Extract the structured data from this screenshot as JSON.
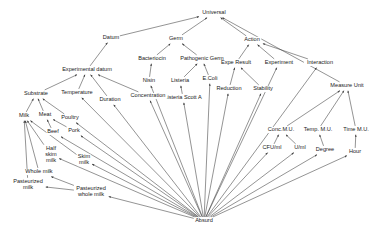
{
  "diagram": {
    "type": "ontology-taxonomy-graph",
    "title": "",
    "edge_style": "arrow",
    "colors": {
      "background": "#ffffff",
      "edge": "#3a3a3a",
      "text": "#1a1a1a"
    },
    "nodes": [
      {
        "id": "universal",
        "label": "Universal",
        "x": 214,
        "y": 13,
        "lines": [
          "Universal"
        ]
      },
      {
        "id": "datum",
        "label": "Datum",
        "x": 111,
        "y": 38,
        "lines": [
          "Datum"
        ]
      },
      {
        "id": "germ",
        "label": "Germ",
        "x": 176,
        "y": 39,
        "lines": [
          "Germ"
        ]
      },
      {
        "id": "action",
        "label": "Action",
        "x": 252,
        "y": 40,
        "lines": [
          "Action"
        ]
      },
      {
        "id": "experimental_datum",
        "label": "Experimental datum",
        "x": 87,
        "y": 70,
        "lines": [
          "Experimental datum"
        ]
      },
      {
        "id": "bacteriocin",
        "label": "Bacteriocin",
        "x": 152,
        "y": 59,
        "lines": [
          "Bacteriocin"
        ]
      },
      {
        "id": "pathogenic_germ",
        "label": "Pathogenic Germ",
        "x": 202,
        "y": 59,
        "lines": [
          "Pathogenic Germ"
        ]
      },
      {
        "id": "expe_result",
        "label": "Expe Result",
        "x": 236,
        "y": 63,
        "lines": [
          "Expe Result"
        ]
      },
      {
        "id": "experiment",
        "label": "Experiment",
        "x": 279,
        "y": 63,
        "lines": [
          "Experiment"
        ]
      },
      {
        "id": "interaction",
        "label": "Interaction",
        "x": 320,
        "y": 63,
        "lines": [
          "Interaction"
        ]
      },
      {
        "id": "nisin",
        "label": "Nisin",
        "x": 149,
        "y": 81,
        "lines": [
          "Nisin"
        ]
      },
      {
        "id": "listeria",
        "label": "Listeria",
        "x": 180,
        "y": 81,
        "lines": [
          "Listeria"
        ]
      },
      {
        "id": "ecoli",
        "label": "E.Coli",
        "x": 210,
        "y": 79,
        "lines": [
          "E.Coli"
        ]
      },
      {
        "id": "listeria_scott_a",
        "label": "Listeria Scott A",
        "x": 183,
        "y": 98,
        "lines": [
          "Listeria Scott A"
        ]
      },
      {
        "id": "reduction",
        "label": "Reduction",
        "x": 229,
        "y": 89,
        "lines": [
          "Reduction"
        ]
      },
      {
        "id": "stability",
        "label": "Stability",
        "x": 263,
        "y": 89,
        "lines": [
          "Stability"
        ]
      },
      {
        "id": "measure_unit",
        "label": "Measure Unit",
        "x": 347,
        "y": 86,
        "lines": [
          "Measure Unit"
        ]
      },
      {
        "id": "substrate",
        "label": "Substrate",
        "x": 36,
        "y": 94,
        "lines": [
          "Substrate"
        ]
      },
      {
        "id": "temperature",
        "label": "Temperature",
        "x": 77,
        "y": 93,
        "lines": [
          "Temperature"
        ]
      },
      {
        "id": "duration",
        "label": "Duration",
        "x": 110,
        "y": 100,
        "lines": [
          "Duration"
        ]
      },
      {
        "id": "concentration",
        "label": "Concentration",
        "x": 148,
        "y": 96,
        "lines": [
          "Concentration"
        ]
      },
      {
        "id": "milk",
        "label": "Milk",
        "x": 24,
        "y": 116,
        "lines": [
          "Milk"
        ]
      },
      {
        "id": "meat",
        "label": "Meat",
        "x": 45,
        "y": 115,
        "lines": [
          "Meat"
        ]
      },
      {
        "id": "poultry",
        "label": "Poultry",
        "x": 70,
        "y": 118,
        "lines": [
          "Poultry"
        ]
      },
      {
        "id": "beef",
        "label": "Beef",
        "x": 53,
        "y": 132,
        "lines": [
          "Beef"
        ]
      },
      {
        "id": "pork",
        "label": "Pork",
        "x": 74,
        "y": 131,
        "lines": [
          "Pork"
        ]
      },
      {
        "id": "half_skim_milk",
        "label": "Half skim milk",
        "x": 51,
        "y": 155,
        "lines": [
          "Half",
          "skim",
          "milk"
        ]
      },
      {
        "id": "skim_milk",
        "label": "Skim milk",
        "x": 84,
        "y": 160,
        "lines": [
          "Skim",
          "milk"
        ]
      },
      {
        "id": "whole_milk",
        "label": "Whole milk",
        "x": 39,
        "y": 172,
        "lines": [
          "Whole milk"
        ]
      },
      {
        "id": "pasteurized_milk",
        "label": "Pasteurized milk",
        "x": 28,
        "y": 185,
        "lines": [
          "Pasteurized",
          "milk"
        ]
      },
      {
        "id": "pasteurized_whole_milk",
        "label": "Pasteurized whole milk",
        "x": 91,
        "y": 192,
        "lines": [
          "Pasteurized",
          "whole milk"
        ]
      },
      {
        "id": "conc_mu",
        "label": "Conc.M.U.",
        "x": 281,
        "y": 130,
        "lines": [
          "Conc.M.U."
        ]
      },
      {
        "id": "temp_mu",
        "label": "Temp. M.U.",
        "x": 318,
        "y": 130,
        "lines": [
          "Temp. M.U."
        ]
      },
      {
        "id": "time_mu",
        "label": "Time M.U.",
        "x": 356,
        "y": 130,
        "lines": [
          "Time M.U."
        ]
      },
      {
        "id": "cfu_ml",
        "label": "CFU/ml",
        "x": 272,
        "y": 148,
        "lines": [
          "CFU/ml"
        ]
      },
      {
        "id": "u_ml",
        "label": "U/ml",
        "x": 300,
        "y": 148,
        "lines": [
          "U/ml"
        ]
      },
      {
        "id": "degree",
        "label": "Degree",
        "x": 325,
        "y": 150,
        "lines": [
          "Degree"
        ]
      },
      {
        "id": "hour",
        "label": "Hour",
        "x": 355,
        "y": 152,
        "lines": [
          "Hour"
        ]
      },
      {
        "id": "absurd",
        "label": "Absurd",
        "x": 204,
        "y": 221,
        "lines": [
          "Absurd"
        ]
      }
    ],
    "edges": [
      {
        "from": "datum",
        "to": "universal"
      },
      {
        "from": "germ",
        "to": "universal"
      },
      {
        "from": "action",
        "to": "universal"
      },
      {
        "from": "measure_unit",
        "to": "universal"
      },
      {
        "from": "experimental_datum",
        "to": "datum"
      },
      {
        "from": "bacteriocin",
        "to": "germ"
      },
      {
        "from": "pathogenic_germ",
        "to": "germ"
      },
      {
        "from": "expe_result",
        "to": "action"
      },
      {
        "from": "experiment",
        "to": "action"
      },
      {
        "from": "interaction",
        "to": "action"
      },
      {
        "from": "nisin",
        "to": "bacteriocin"
      },
      {
        "from": "listeria",
        "to": "pathogenic_germ"
      },
      {
        "from": "ecoli",
        "to": "pathogenic_germ"
      },
      {
        "from": "listeria_scott_a",
        "to": "listeria"
      },
      {
        "from": "reduction",
        "to": "expe_result"
      },
      {
        "from": "stability",
        "to": "expe_result"
      },
      {
        "from": "substrate",
        "to": "experimental_datum"
      },
      {
        "from": "temperature",
        "to": "experimental_datum"
      },
      {
        "from": "duration",
        "to": "experimental_datum"
      },
      {
        "from": "concentration",
        "to": "experimental_datum"
      },
      {
        "from": "milk",
        "to": "substrate"
      },
      {
        "from": "meat",
        "to": "substrate"
      },
      {
        "from": "poultry",
        "to": "substrate"
      },
      {
        "from": "beef",
        "to": "meat"
      },
      {
        "from": "pork",
        "to": "meat"
      },
      {
        "from": "half_skim_milk",
        "to": "milk"
      },
      {
        "from": "skim_milk",
        "to": "milk"
      },
      {
        "from": "whole_milk",
        "to": "milk"
      },
      {
        "from": "pasteurized_milk",
        "to": "milk"
      },
      {
        "from": "pasteurized_whole_milk",
        "to": "pasteurized_milk"
      },
      {
        "from": "pasteurized_whole_milk",
        "to": "whole_milk"
      },
      {
        "from": "conc_mu",
        "to": "measure_unit"
      },
      {
        "from": "temp_mu",
        "to": "measure_unit"
      },
      {
        "from": "time_mu",
        "to": "measure_unit"
      },
      {
        "from": "cfu_ml",
        "to": "conc_mu"
      },
      {
        "from": "u_ml",
        "to": "conc_mu"
      },
      {
        "from": "degree",
        "to": "temp_mu"
      },
      {
        "from": "hour",
        "to": "time_mu"
      },
      {
        "from": "absurd",
        "to": "pasteurized_whole_milk"
      },
      {
        "from": "absurd",
        "to": "half_skim_milk"
      },
      {
        "from": "absurd",
        "to": "skim_milk"
      },
      {
        "from": "absurd",
        "to": "beef"
      },
      {
        "from": "absurd",
        "to": "pork"
      },
      {
        "from": "absurd",
        "to": "poultry"
      },
      {
        "from": "absurd",
        "to": "temperature"
      },
      {
        "from": "absurd",
        "to": "duration"
      },
      {
        "from": "absurd",
        "to": "concentration"
      },
      {
        "from": "absurd",
        "to": "nisin"
      },
      {
        "from": "absurd",
        "to": "listeria_scott_a"
      },
      {
        "from": "absurd",
        "to": "ecoli"
      },
      {
        "from": "absurd",
        "to": "reduction"
      },
      {
        "from": "absurd",
        "to": "stability"
      },
      {
        "from": "absurd",
        "to": "experiment"
      },
      {
        "from": "absurd",
        "to": "interaction"
      },
      {
        "from": "absurd",
        "to": "cfu_ml"
      },
      {
        "from": "absurd",
        "to": "u_ml"
      },
      {
        "from": "absurd",
        "to": "degree"
      },
      {
        "from": "absurd",
        "to": "hour"
      }
    ]
  }
}
